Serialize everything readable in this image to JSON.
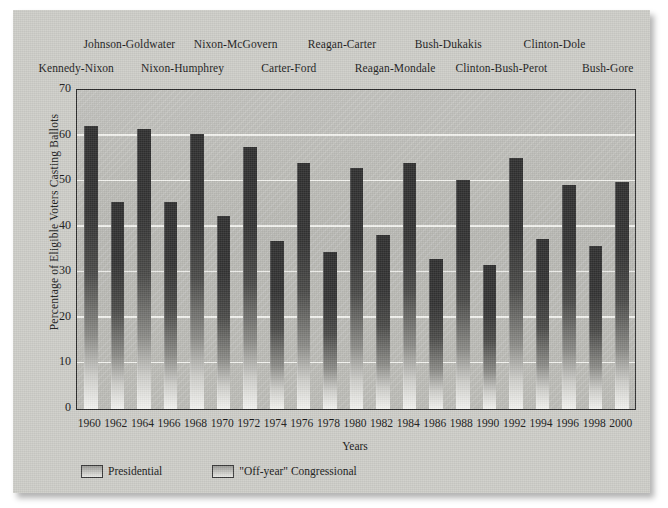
{
  "chart_data": {
    "type": "bar",
    "title": "",
    "xlabel": "Years",
    "ylabel": "Percentage of Eligible Voters Casting Ballots",
    "ylim": [
      0,
      70
    ],
    "yticks": [
      0,
      10,
      20,
      30,
      40,
      50,
      60,
      70
    ],
    "grid": true,
    "legend_position": "below-axis-left",
    "categories": [
      "1960",
      "1962",
      "1964",
      "1966",
      "1968",
      "1970",
      "1972",
      "1974",
      "1976",
      "1978",
      "1980",
      "1982",
      "1984",
      "1986",
      "1988",
      "1990",
      "1992",
      "1994",
      "1996",
      "1998",
      "2000"
    ],
    "values": [
      62.0,
      45.5,
      61.5,
      45.5,
      60.3,
      42.3,
      57.5,
      36.8,
      53.9,
      34.4,
      52.9,
      38.2,
      54.0,
      32.9,
      50.2,
      31.7,
      55.0,
      37.4,
      49.2,
      35.7,
      49.9
    ],
    "series": [
      {
        "name": "Presidential",
        "points": [
          {
            "year": "1960",
            "value": 62.0
          },
          {
            "year": "1964",
            "value": 61.5
          },
          {
            "year": "1968",
            "value": 60.3
          },
          {
            "year": "1972",
            "value": 57.5
          },
          {
            "year": "1976",
            "value": 53.9
          },
          {
            "year": "1980",
            "value": 52.9
          },
          {
            "year": "1984",
            "value": 54.0
          },
          {
            "year": "1988",
            "value": 50.2
          },
          {
            "year": "1992",
            "value": 55.0
          },
          {
            "year": "1996",
            "value": 49.2
          },
          {
            "year": "2000",
            "value": 49.9
          }
        ]
      },
      {
        "name": "\"Off-year\" Congressional",
        "points": [
          {
            "year": "1962",
            "value": 45.5
          },
          {
            "year": "1966",
            "value": 45.5
          },
          {
            "year": "1970",
            "value": 42.3
          },
          {
            "year": "1974",
            "value": 36.8
          },
          {
            "year": "1978",
            "value": 34.4
          },
          {
            "year": "1982",
            "value": 38.2
          },
          {
            "year": "1986",
            "value": 32.9
          },
          {
            "year": "1990",
            "value": 31.7
          },
          {
            "year": "1994",
            "value": 37.4
          },
          {
            "year": "1998",
            "value": 35.7
          }
        ]
      }
    ],
    "annotations": [
      {
        "text": "Kennedy-Nixon",
        "row": "lower",
        "year": "1960"
      },
      {
        "text": "Johnson-Goldwater",
        "row": "upper",
        "year": "1964"
      },
      {
        "text": "Nixon-Humphrey",
        "row": "lower",
        "year": "1968"
      },
      {
        "text": "Nixon-McGovern",
        "row": "upper",
        "year": "1972"
      },
      {
        "text": "Carter-Ford",
        "row": "lower",
        "year": "1976"
      },
      {
        "text": "Reagan-Carter",
        "row": "upper",
        "year": "1980"
      },
      {
        "text": "Reagan-Mondale",
        "row": "lower",
        "year": "1984"
      },
      {
        "text": "Bush-Dukakis",
        "row": "upper",
        "year": "1988"
      },
      {
        "text": "Clinton-Bush-Perot",
        "row": "lower",
        "year": "1992"
      },
      {
        "text": "Clinton-Dole",
        "row": "upper",
        "year": "1996"
      },
      {
        "text": "Bush-Gore",
        "row": "lower",
        "year": "2000"
      }
    ]
  },
  "legend": {
    "items": [
      {
        "label": "Presidential"
      },
      {
        "label": "\"Off-year\" Congressional"
      }
    ]
  },
  "colors": {
    "paper": "#cdcdc8",
    "plot_background": "#b9b9b4",
    "bar_top": "#2f2f2f",
    "bar_bottom": "#f3f3f0",
    "gridline": "#f2f2ee",
    "axis": "#2b2b2b",
    "text": "#161616"
  }
}
